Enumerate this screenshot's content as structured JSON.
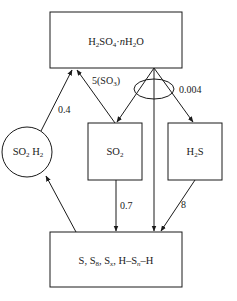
{
  "diagram": {
    "type": "sulfur-species-flow",
    "nodes": {
      "top": {
        "id": "h2so4",
        "shape": "rectangle",
        "formula": {
          "parts": [
            "H",
            "2",
            "SO",
            "4",
            "·",
            "n",
            "H",
            "2",
            "O"
          ]
        },
        "text": "H2SO4·nH2O"
      },
      "circle": {
        "id": "so2h2",
        "shape": "circle",
        "text": "SO2 H2"
      },
      "so2": {
        "id": "so2",
        "shape": "rectangle",
        "text": "SO2"
      },
      "h2s": {
        "id": "h2s",
        "shape": "rectangle",
        "text": "H2S"
      },
      "bottom": {
        "id": "sulfur",
        "shape": "rectangle",
        "text": "S, S8, Sx, H–Sn–H"
      }
    },
    "edges": [
      {
        "from": "so2h2",
        "to": "h2so4",
        "label": "0.4"
      },
      {
        "from": "so2",
        "to": "h2so4",
        "label": "5(SO3)"
      },
      {
        "from": "h2so4",
        "to": "so2",
        "label": ""
      },
      {
        "from": "h2so4",
        "to": "h2s",
        "label": "0.004"
      },
      {
        "from": "h2so4",
        "to": "sulfur",
        "label": ""
      },
      {
        "from": "so2",
        "to": "sulfur",
        "label": "0.7"
      },
      {
        "from": "h2s",
        "to": "sulfur",
        "label": "8"
      },
      {
        "from": "sulfur",
        "to": "so2h2",
        "label": ""
      }
    ],
    "labels": {
      "e_04": "0.4",
      "e_5so3": "5(SO",
      "e_5so3_sub": "3",
      "e_5so3_close": ")",
      "e_0004": "0.004",
      "e_07": "0.7",
      "e_8": "8"
    },
    "text_parts": {
      "top": {
        "a": "H",
        "a_sub": "2",
        "b": "SO",
        "b_sub": "4",
        "c": "·",
        "n": "n",
        "d": "H",
        "d_sub": "2",
        "e": "O"
      },
      "circle": {
        "a": "SO",
        "a_sub": "2",
        "b": " H",
        "b_sub": "2"
      },
      "so2": {
        "a": "SO",
        "a_sub": "2"
      },
      "h2s": {
        "a": "H",
        "a_sub": "2",
        "b": "S"
      },
      "bottom": {
        "a": "S,  S",
        "a_sub": "8",
        "b": ",  S",
        "b_sub": "x",
        "c": ", H–S",
        "c_sub": "n",
        "d": "–H"
      }
    },
    "colors": {
      "stroke": "#1a1a1a",
      "background": "#ffffff"
    }
  }
}
